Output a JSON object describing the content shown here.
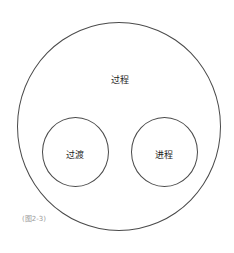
{
  "diagram": {
    "outer": {
      "label": "过程"
    },
    "inner": [
      {
        "label": "过渡"
      },
      {
        "label": "进程"
      }
    ],
    "caption": "(图2-3)",
    "colors": {
      "stroke": "#4a4a4a",
      "text": "#222222",
      "caption": "#9a9a9a",
      "background": "#ffffff"
    }
  }
}
